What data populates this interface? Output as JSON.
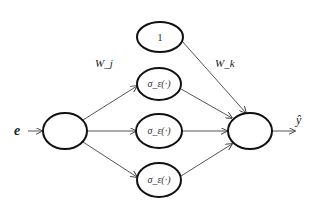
{
  "diagram": {
    "type": "neural-network",
    "colors": {
      "stroke": "#111111",
      "edge": "#555555",
      "text": "#222222",
      "background": "#ffffff"
    },
    "input_label": "e",
    "output_label": "ŷ",
    "weight_labels": {
      "input_to_hidden": "W_j",
      "hidden_to_output": "W_k"
    },
    "nodes": [
      {
        "id": "bias",
        "label": "1"
      },
      {
        "id": "hidden-1",
        "label": "σ_ε(·)"
      },
      {
        "id": "hidden-2",
        "label": "σ_ε(·)"
      },
      {
        "id": "hidden-3",
        "label": "σ_ε(·)"
      },
      {
        "id": "input",
        "label": ""
      },
      {
        "id": "output",
        "label": ""
      }
    ],
    "edges": [
      {
        "from": "e",
        "to": "input"
      },
      {
        "from": "input",
        "to": "hidden-1"
      },
      {
        "from": "input",
        "to": "hidden-2"
      },
      {
        "from": "input",
        "to": "hidden-3"
      },
      {
        "from": "bias",
        "to": "output"
      },
      {
        "from": "hidden-1",
        "to": "output"
      },
      {
        "from": "hidden-2",
        "to": "output"
      },
      {
        "from": "hidden-3",
        "to": "output"
      },
      {
        "from": "output",
        "to": "ŷ"
      }
    ]
  }
}
